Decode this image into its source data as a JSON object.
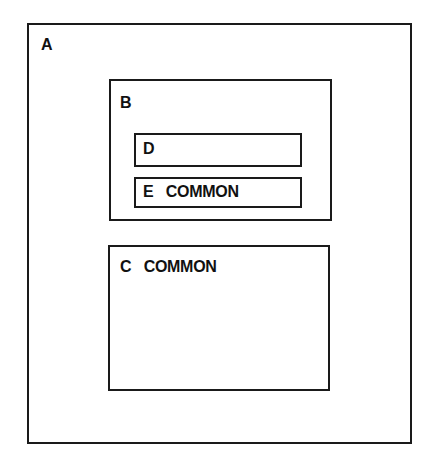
{
  "diagram": {
    "type": "nested-scope-boxes",
    "boxes": [
      {
        "id": "A",
        "label": "A",
        "parent": null
      },
      {
        "id": "B",
        "label": "B",
        "parent": "A"
      },
      {
        "id": "D",
        "label": "D",
        "parent": "B"
      },
      {
        "id": "E",
        "label": "E   COMMON",
        "parent": "B"
      },
      {
        "id": "C",
        "label": "C   COMMON",
        "parent": "A"
      }
    ]
  },
  "labels": {
    "a": "A",
    "b": "B",
    "d": "D",
    "e": "E   COMMON",
    "c": "C   COMMON"
  },
  "colors": {
    "line": "#1a1a1a",
    "background": "#ffffff"
  }
}
